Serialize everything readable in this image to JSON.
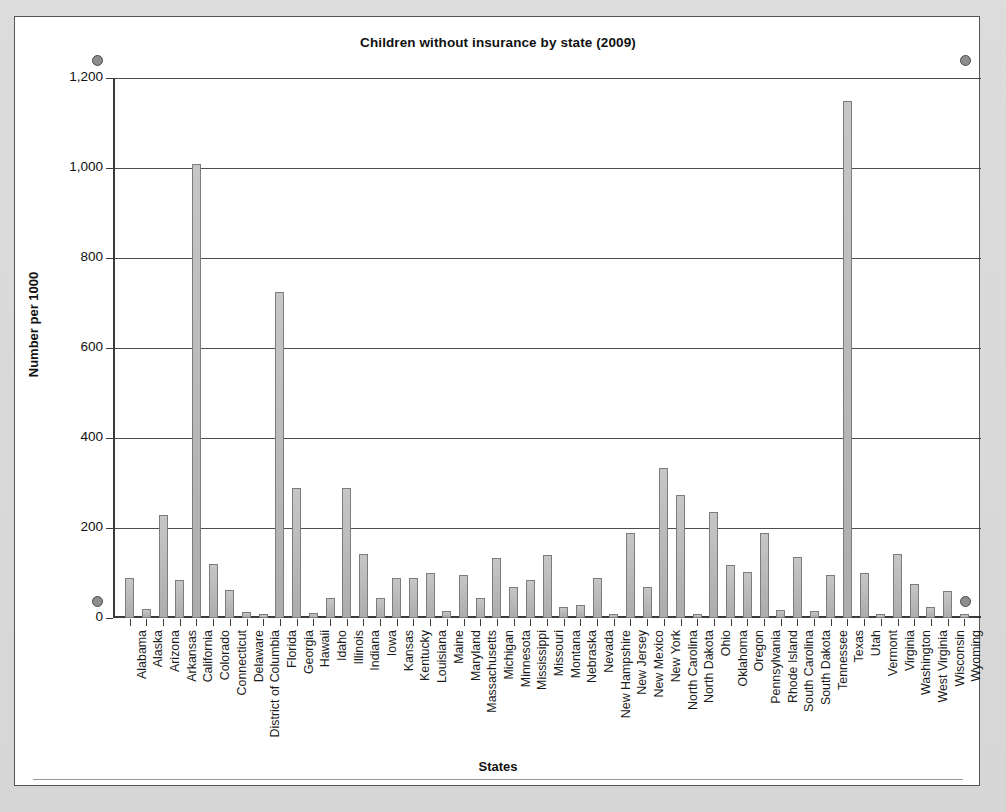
{
  "document": {
    "background_color": "#d9d9d9",
    "object_border_color": "#555555",
    "selection_handle_color": "#8d8d8d"
  },
  "chart_data": {
    "type": "bar",
    "title": "Children without insurance by state (2009)",
    "xlabel": "States",
    "ylabel": "Number per 1000",
    "ylim": [
      0,
      1200
    ],
    "ytick_labels": [
      "0",
      "200",
      "400",
      "600",
      "800",
      "1,000",
      "1,200"
    ],
    "ytick_values": [
      0,
      200,
      400,
      600,
      800,
      1000,
      1200
    ],
    "grid": true,
    "legend": "none",
    "bar_color": "#a8a8a8",
    "bar_border_color": "#7c7c7c",
    "categories": [
      "Alabama",
      "Alaska",
      "Arizona",
      "Arkansas",
      "California",
      "Colorado",
      "Connecticut",
      "Delaware",
      "District of Columbia",
      "Florida",
      "Georgia",
      "Hawaii",
      "Idaho",
      "Illinois",
      "Indiana",
      "Iowa",
      "Kansas",
      "Kentucky",
      "Louisiana",
      "Maine",
      "Maryland",
      "Massachusetts",
      "Michigan",
      "Minnesota",
      "Mississippi",
      "Missouri",
      "Montana",
      "Nebraska",
      "Nevada",
      "New Hampshire",
      "New Jersey",
      "New Mexico",
      "New York",
      "North Carolina",
      "North Dakota",
      "Ohio",
      "Oklahoma",
      "Oregon",
      "Pennsylvania",
      "Rhode Island",
      "South Carolina",
      "South Dakota",
      "Tennessee",
      "Texas",
      "Utah",
      "Vermont",
      "Virginia",
      "Washington",
      "West Virginia",
      "Wisconsin",
      "Wyoming"
    ],
    "values": [
      88,
      20,
      228,
      85,
      1008,
      120,
      62,
      14,
      10,
      725,
      290,
      12,
      45,
      288,
      142,
      45,
      88,
      90,
      100,
      15,
      95,
      45,
      133,
      70,
      85,
      140,
      25,
      30,
      88,
      10,
      188,
      70,
      333,
      273,
      10,
      235,
      118,
      103,
      190,
      18,
      135,
      15,
      95,
      1148,
      100,
      8,
      143,
      75,
      25,
      60,
      8
    ]
  }
}
